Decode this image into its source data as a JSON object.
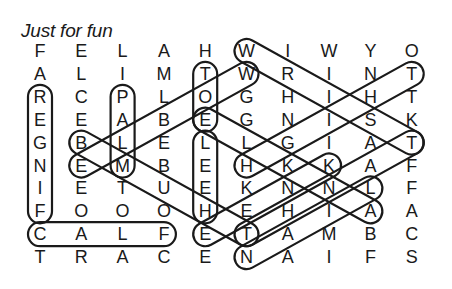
{
  "title": "Just for fun",
  "grid": [
    [
      "F",
      "E",
      "L",
      "A",
      "H",
      "W",
      "I",
      "W",
      "Y",
      "O"
    ],
    [
      "A",
      "L",
      "I",
      "M",
      "T",
      "W",
      "R",
      "I",
      "N",
      "T"
    ],
    [
      "R",
      "C",
      "P",
      "L",
      "O",
      "G",
      "H",
      "I",
      "H",
      "T"
    ],
    [
      "E",
      "E",
      "A",
      "B",
      "E",
      "G",
      "N",
      "I",
      "S",
      "K"
    ],
    [
      "G",
      "B",
      "L",
      "E",
      "L",
      "L",
      "G",
      "I",
      "A",
      "T"
    ],
    [
      "N",
      "E",
      "M",
      "B",
      "E",
      "H",
      "K",
      "K",
      "A",
      "F"
    ],
    [
      "I",
      "E",
      "T",
      "U",
      "E",
      "K",
      "N",
      "N",
      "L",
      "F"
    ],
    [
      "F",
      "O",
      "O",
      "O",
      "H",
      "E",
      "H",
      "I",
      "A",
      "A"
    ],
    [
      "C",
      "A",
      "L",
      "F",
      "E",
      "T",
      "A",
      "M",
      "B",
      "C"
    ],
    [
      "T",
      "R",
      "A",
      "C",
      "E",
      "N",
      "A",
      "I",
      "F",
      "S"
    ]
  ],
  "circled_words": [
    {
      "from": [
        2,
        0
      ],
      "to": [
        7,
        0
      ]
    },
    {
      "from": [
        2,
        2
      ],
      "to": [
        5,
        2
      ]
    },
    {
      "from": [
        1,
        4
      ],
      "to": [
        3,
        4
      ]
    },
    {
      "from": [
        4,
        4
      ],
      "to": [
        7,
        4
      ]
    },
    {
      "from": [
        8,
        0
      ],
      "to": [
        8,
        3
      ]
    },
    {
      "from": [
        0,
        5
      ],
      "to": [
        4,
        9
      ]
    },
    {
      "from": [
        5,
        1
      ],
      "to": [
        1,
        5
      ]
    },
    {
      "from": [
        4,
        1
      ],
      "to": [
        8,
        5
      ]
    },
    {
      "from": [
        1,
        9
      ],
      "to": [
        5,
        5
      ]
    },
    {
      "from": [
        3,
        4
      ],
      "to": [
        7,
        8
      ]
    },
    {
      "from": [
        8,
        4
      ],
      "to": [
        5,
        7
      ]
    },
    {
      "from": [
        9,
        5
      ],
      "to": [
        6,
        8
      ]
    },
    {
      "from": [
        8,
        5
      ],
      "to": [
        4,
        9
      ]
    }
  ]
}
